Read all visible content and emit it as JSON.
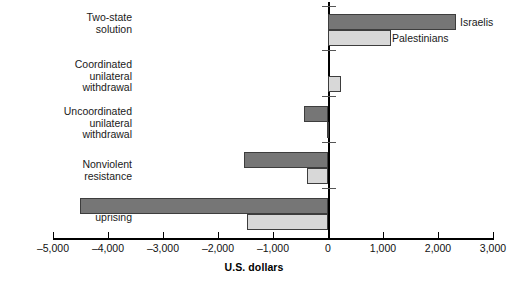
{
  "chart_data": {
    "type": "bar",
    "orientation": "horizontal",
    "title": "",
    "xlabel": "U.S. dollars",
    "ylabel": "",
    "xlim": [
      -5000,
      3000
    ],
    "xticks": [
      -5000,
      -4000,
      -3000,
      -2000,
      -1000,
      0,
      1000,
      2000,
      3000
    ],
    "xticklabels": [
      "–5,000",
      "–4,000",
      "–3,000",
      "–2,000",
      "–1,000",
      "0",
      "1,000",
      "2,000",
      "3,000"
    ],
    "grid": false,
    "legend_position": "inline-right-of-top-bars",
    "categories": [
      "Two-state\nsolution",
      "Coordinated\nunilateral\nwithdrawal",
      "Uncoordinated\nunilateral\nwithdrawal",
      "Nonviolent\nresistance",
      "Violent\nuprising"
    ],
    "series": [
      {
        "name": "Israelis",
        "color": "#767676",
        "values": [
          2320,
          0,
          -440,
          -1530,
          -4510
        ]
      },
      {
        "name": "Palestinians",
        "color": "#d8d8d8",
        "values": [
          1140,
          240,
          -20,
          -390,
          -1470
        ]
      }
    ]
  },
  "axis": {
    "title": "U.S. dollars"
  },
  "legend": {
    "israelis_label": "Israelis",
    "palestinians_label": "Palestinians"
  }
}
